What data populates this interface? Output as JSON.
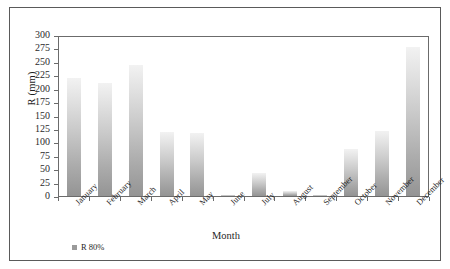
{
  "chart_data": {
    "type": "bar",
    "title": "",
    "xlabel": "Month",
    "ylabel": "R (mm)",
    "categories": [
      "January",
      "February",
      "March",
      "April",
      "May",
      "June",
      "July",
      "August",
      "September",
      "October",
      "November",
      "December"
    ],
    "values": [
      220,
      211,
      245,
      119,
      117,
      2,
      42,
      10,
      1,
      88,
      122,
      277
    ],
    "series": [
      {
        "name": "R 80%",
        "values": [
          220,
          211,
          245,
          119,
          117,
          2,
          42,
          10,
          1,
          88,
          122,
          277
        ]
      }
    ],
    "ylim": [
      0,
      300
    ],
    "ytick_step": 25,
    "ytick_labels": [
      "0",
      "25",
      "50",
      "75",
      "100",
      "125",
      "150",
      "175",
      "200",
      "225",
      "250",
      "275",
      "300"
    ],
    "grid": false,
    "legend_position": "bottom-left",
    "legend_entries": [
      "R 80%"
    ],
    "bar_color_top": "#f2f2f2",
    "bar_color_bottom": "#949494",
    "axis_color": "#6b6b6b",
    "text_color": "#1f1f1f",
    "frame_color": "#5a5a5a",
    "background": "#ffffff"
  },
  "legend": {
    "label": "R 80%"
  },
  "axes": {
    "x_title": "Month",
    "y_title": "R (mm)"
  }
}
